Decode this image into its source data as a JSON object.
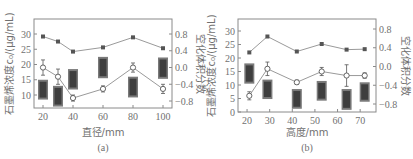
{
  "chart_data": [
    {
      "type": "line",
      "panel": "(a)",
      "caption": "(a)",
      "xlabel": "直径/mm",
      "ylabel_left": "石墨烯浓度c₀/(μg/mL)",
      "ylabel_right": "空化体积分数",
      "x": [
        20,
        30,
        40,
        60,
        80,
        100
      ],
      "x_ticks": [
        "20",
        "40",
        "60",
        "80",
        "100"
      ],
      "y_left_ticks": [
        "10",
        "15",
        "20",
        "25",
        "30"
      ],
      "y_right_ticks": [
        "0.8",
        "0.4",
        "0.0",
        "-0.4",
        "-0.8"
      ],
      "ylim_left": [
        6,
        36
      ],
      "ylim_right": [
        -0.95,
        1.1
      ],
      "series": [
        {
          "name": "空化体积分数",
          "axis": "right",
          "marker": "filled-square",
          "values": [
            0.74,
            0.62,
            0.38,
            0.48,
            0.72,
            0.46
          ]
        },
        {
          "name": "石墨烯浓度",
          "axis": "left",
          "marker": "open-circle",
          "values": [
            19,
            16,
            9,
            12,
            19,
            12
          ],
          "errors": [
            2.5,
            2.5,
            1,
            1,
            1.5,
            1.5
          ]
        }
      ],
      "bars": [
        {
          "x": 20,
          "top": 15,
          "bottom": 8.5
        },
        {
          "x": 30,
          "top": 13,
          "bottom": 6.2
        },
        {
          "x": 40,
          "top": 18.5,
          "bottom": 11.8
        },
        {
          "x": 60,
          "top": 22.5,
          "bottom": 15.5
        },
        {
          "x": 80,
          "top": 16,
          "bottom": 9.2
        },
        {
          "x": 100,
          "top": 22.3,
          "bottom": 15.3
        }
      ]
    },
    {
      "type": "line",
      "panel": "(b)",
      "caption": "(b)",
      "xlabel": "高度/mm",
      "ylabel_left": "石墨烯浓度c₀/(μg/mL)",
      "ylabel_right": "空化体积分数",
      "x": [
        21,
        29,
        42,
        53,
        64,
        72
      ],
      "x_ticks": [
        "20",
        "30",
        "40",
        "50",
        "60",
        "70"
      ],
      "y_left_ticks": [
        "0",
        "5",
        "10",
        "15",
        "20",
        "25",
        "30"
      ],
      "y_right_ticks": [
        "0.8",
        "0.4",
        "0.0",
        "-0.4",
        "-0.8"
      ],
      "ylim_left": [
        0,
        36
      ],
      "ylim_right": [
        -0.95,
        1.1
      ],
      "series": [
        {
          "name": "空化体积分数",
          "axis": "right",
          "marker": "filled-square",
          "values": [
            0.3,
            0.64,
            0.32,
            0.48,
            0.36,
            0.37
          ]
        },
        {
          "name": "石墨烯浓度",
          "axis": "left",
          "marker": "open-circle",
          "values": [
            6,
            16,
            11,
            15,
            13.5,
            13.5
          ],
          "errors": [
            1.5,
            2.5,
            0.8,
            1.5,
            4,
            1
          ]
        }
      ],
      "bars": [
        {
          "x": 21,
          "top": 18,
          "bottom": 10.5
        },
        {
          "x": 29,
          "top": 12,
          "bottom": 4.8
        },
        {
          "x": 42,
          "top": 8.5,
          "bottom": 1.2
        },
        {
          "x": 53,
          "top": 11.5,
          "bottom": 4.2
        },
        {
          "x": 64,
          "top": 8.5,
          "bottom": 0.8
        },
        {
          "x": 72,
          "top": 11,
          "bottom": 3.8
        }
      ]
    }
  ],
  "panels": {
    "a": {
      "caption": "(a)",
      "xlabel": "直径/mm",
      "ylabel_left": "石墨烯浓度c₀/(μg/mL)",
      "ylabel_right": "空化体积分数"
    },
    "b": {
      "caption": "(b)",
      "xlabel": "高度/mm",
      "ylabel_left": "石墨烯浓度c₀/(μg/mL)",
      "ylabel_right": "空化体积分数"
    }
  },
  "colors": {
    "axis": "#8a8a8a",
    "line": "#9a9a9a",
    "marker": "#555555",
    "bar": "#3e3e3e",
    "bar_light": "#7a7a7a"
  }
}
